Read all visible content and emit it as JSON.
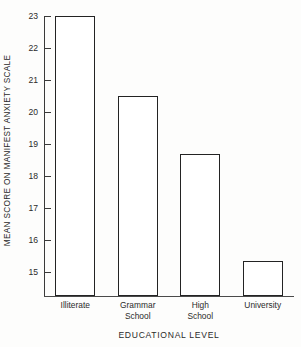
{
  "chart_data": {
    "type": "bar",
    "title": "",
    "subtitle": "",
    "xlabel": "EDUCATIONAL LEVEL",
    "ylabel": "MEAN SCORE ON MANIFEST ANXIETY SCALE",
    "categories": [
      "Illiterate",
      "Grammar School",
      "High School",
      "University"
    ],
    "category_lines": [
      [
        "Illiterate"
      ],
      [
        "Grammar",
        "School"
      ],
      [
        "High",
        "School"
      ],
      [
        "University"
      ]
    ],
    "values": [
      23.0,
      20.5,
      18.7,
      15.35
    ],
    "ylim": [
      14.6,
      23.4
    ],
    "yticks": [
      23,
      22,
      21,
      20,
      19,
      18,
      17,
      16,
      15
    ],
    "ytick_labels": [
      "23",
      "22",
      "21",
      "20",
      "19",
      "18",
      "17",
      "16",
      "15"
    ],
    "grid": false,
    "legend": null,
    "legend_position": "none",
    "bar_facecolor": "#ffffff",
    "bar_edgecolor": "#232323",
    "axis_color": "#3a3a3a"
  }
}
